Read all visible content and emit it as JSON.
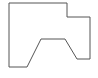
{
  "canvas": {
    "width": 98,
    "height": 78,
    "background": "#ffffff"
  },
  "shape": {
    "type": "polygon",
    "stroke": "#555555",
    "stroke_width": 1,
    "fill": "none",
    "points": "9,3 67,3 67,17 90,17 90,59 77,59 65,39 41,39 27,67 9,67"
  }
}
